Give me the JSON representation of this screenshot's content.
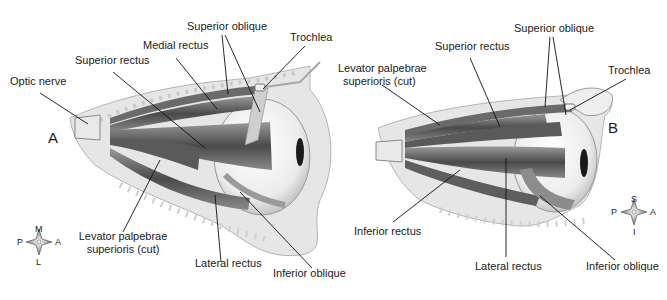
{
  "figure": {
    "panels": [
      {
        "id": "A",
        "letter": "A",
        "view": "superior view, left eye",
        "labels": {
          "optic_nerve": "Optic nerve",
          "superior_rectus": "Superior rectus",
          "medial_rectus": "Medial rectus",
          "superior_oblique": "Superior oblique",
          "trochlea": "Trochlea",
          "levator_line1": "Levator palpebrae",
          "levator_line2": "superioris (cut)",
          "lateral_rectus": "Lateral rectus",
          "inferior_oblique": "Inferior oblique"
        },
        "compass": {
          "top": "M",
          "bottom": "L",
          "left": "P",
          "right": "A"
        }
      },
      {
        "id": "B",
        "letter": "B",
        "view": "lateral view",
        "labels": {
          "levator_line1": "Levator palpebrae",
          "levator_line2": "superioris (cut)",
          "superior_rectus": "Superior rectus",
          "superior_oblique": "Superior oblique",
          "trochlea": "Trochlea",
          "inferior_rectus": "Inferior rectus",
          "lateral_rectus": "Lateral rectus",
          "inferior_oblique": "Inferior oblique"
        },
        "compass": {
          "top": "S",
          "bottom": "I",
          "left": "P",
          "right": "A"
        }
      }
    ],
    "colors": {
      "background": "#ffffff",
      "muscle_dark": "#4a4a4a",
      "muscle_mid": "#7a7a7a",
      "bone": "#e4e4e4",
      "eyeball": "#f2f2f2",
      "leader_line": "#111111"
    }
  }
}
